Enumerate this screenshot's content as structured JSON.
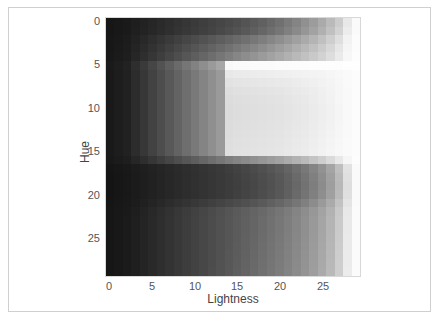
{
  "chart_data": {
    "type": "heatmap",
    "title": "",
    "xlabel": "Lightness",
    "ylabel": "Hue",
    "colormap": "grayscale",
    "x_ticks": [
      0,
      5,
      10,
      15,
      20,
      25
    ],
    "y_ticks": [
      0,
      5,
      10,
      15,
      20,
      25
    ],
    "xlim": [
      0,
      29
    ],
    "ylim": [
      29,
      0
    ],
    "grid": false,
    "legend": null,
    "n_rows": 30,
    "n_cols": 30,
    "value_range": [
      0,
      255
    ],
    "values": [
      [
        22,
        24,
        26,
        30,
        34,
        38,
        42,
        46,
        50,
        54,
        58,
        62,
        66,
        70,
        74,
        78,
        84,
        90,
        96,
        104,
        112,
        122,
        132,
        144,
        156,
        170,
        186,
        204,
        232,
        250
      ],
      [
        22,
        24,
        26,
        31,
        35,
        39,
        43,
        47,
        52,
        56,
        60,
        64,
        68,
        73,
        78,
        83,
        89,
        95,
        102,
        110,
        118,
        128,
        138,
        150,
        162,
        176,
        192,
        210,
        236,
        250
      ],
      [
        23,
        25,
        28,
        34,
        40,
        46,
        52,
        58,
        64,
        70,
        76,
        82,
        88,
        94,
        100,
        106,
        112,
        119,
        126,
        134,
        142,
        151,
        160,
        170,
        180,
        192,
        206,
        222,
        242,
        252
      ],
      [
        23,
        26,
        29,
        36,
        43,
        50,
        57,
        64,
        71,
        78,
        85,
        92,
        99,
        106,
        113,
        120,
        127,
        134,
        141,
        149,
        157,
        165,
        174,
        183,
        192,
        203,
        215,
        230,
        245,
        252
      ],
      [
        24,
        27,
        30,
        38,
        46,
        54,
        62,
        70,
        78,
        86,
        94,
        102,
        110,
        118,
        126,
        134,
        141,
        148,
        155,
        162,
        169,
        177,
        185,
        193,
        201,
        210,
        221,
        234,
        247,
        253
      ],
      [
        26,
        30,
        34,
        46,
        58,
        70,
        82,
        94,
        106,
        118,
        130,
        142,
        154,
        166,
        248,
        250,
        250,
        251,
        251,
        251,
        252,
        252,
        252,
        252,
        253,
        253,
        253,
        253,
        254,
        254
      ],
      [
        25,
        29,
        33,
        44,
        55,
        66,
        77,
        88,
        99,
        110,
        121,
        132,
        143,
        154,
        232,
        234,
        235,
        236,
        237,
        238,
        239,
        240,
        241,
        242,
        243,
        244,
        246,
        248,
        250,
        252
      ],
      [
        25,
        29,
        33,
        44,
        55,
        66,
        77,
        88,
        99,
        110,
        121,
        132,
        143,
        154,
        226,
        228,
        229,
        230,
        231,
        232,
        233,
        234,
        236,
        238,
        240,
        242,
        244,
        247,
        250,
        252
      ],
      [
        25,
        29,
        33,
        44,
        55,
        66,
        77,
        88,
        99,
        110,
        121,
        132,
        143,
        154,
        222,
        224,
        225,
        226,
        227,
        228,
        229,
        231,
        233,
        235,
        237,
        240,
        243,
        246,
        249,
        252
      ],
      [
        25,
        29,
        33,
        44,
        55,
        66,
        77,
        88,
        99,
        110,
        121,
        132,
        143,
        154,
        220,
        222,
        223,
        224,
        225,
        226,
        227,
        229,
        231,
        233,
        236,
        239,
        242,
        246,
        249,
        252
      ],
      [
        25,
        29,
        33,
        44,
        55,
        66,
        77,
        88,
        99,
        110,
        121,
        132,
        143,
        154,
        219,
        221,
        222,
        223,
        224,
        225,
        226,
        228,
        230,
        232,
        235,
        238,
        241,
        245,
        249,
        252
      ],
      [
        25,
        29,
        33,
        44,
        55,
        66,
        77,
        88,
        99,
        110,
        121,
        132,
        143,
        154,
        219,
        221,
        222,
        223,
        224,
        225,
        226,
        228,
        230,
        232,
        235,
        238,
        241,
        245,
        249,
        252
      ],
      [
        25,
        29,
        33,
        44,
        55,
        66,
        77,
        88,
        99,
        110,
        121,
        132,
        143,
        154,
        220,
        222,
        223,
        224,
        225,
        226,
        227,
        229,
        231,
        233,
        236,
        239,
        242,
        246,
        249,
        252
      ],
      [
        25,
        29,
        33,
        44,
        55,
        66,
        77,
        88,
        99,
        110,
        121,
        132,
        143,
        154,
        221,
        223,
        224,
        225,
        226,
        227,
        228,
        230,
        232,
        234,
        237,
        240,
        243,
        246,
        249,
        252
      ],
      [
        25,
        29,
        33,
        44,
        55,
        66,
        77,
        88,
        99,
        110,
        121,
        132,
        143,
        154,
        222,
        224,
        225,
        226,
        227,
        228,
        229,
        231,
        233,
        235,
        238,
        241,
        244,
        247,
        250,
        252
      ],
      [
        25,
        29,
        33,
        44,
        55,
        66,
        77,
        88,
        99,
        110,
        121,
        132,
        143,
        154,
        223,
        225,
        226,
        227,
        228,
        229,
        230,
        232,
        234,
        236,
        239,
        242,
        245,
        248,
        250,
        252
      ],
      [
        24,
        27,
        30,
        38,
        46,
        54,
        62,
        70,
        78,
        86,
        94,
        102,
        110,
        118,
        126,
        132,
        138,
        144,
        150,
        156,
        162,
        170,
        178,
        186,
        196,
        206,
        218,
        232,
        246,
        253
      ],
      [
        21,
        23,
        25,
        28,
        31,
        34,
        37,
        40,
        43,
        46,
        49,
        52,
        55,
        58,
        62,
        66,
        70,
        75,
        80,
        86,
        92,
        100,
        110,
        120,
        132,
        146,
        164,
        190,
        226,
        250
      ],
      [
        20,
        22,
        24,
        27,
        30,
        33,
        36,
        39,
        42,
        45,
        48,
        51,
        54,
        57,
        60,
        64,
        68,
        72,
        77,
        82,
        88,
        96,
        106,
        116,
        128,
        142,
        160,
        186,
        224,
        250
      ],
      [
        20,
        22,
        24,
        27,
        30,
        33,
        36,
        39,
        42,
        45,
        48,
        51,
        54,
        57,
        60,
        63,
        67,
        71,
        76,
        81,
        87,
        95,
        104,
        114,
        126,
        140,
        158,
        184,
        222,
        250
      ],
      [
        20,
        22,
        24,
        27,
        30,
        33,
        36,
        39,
        42,
        45,
        48,
        51,
        54,
        57,
        60,
        64,
        68,
        72,
        77,
        82,
        88,
        96,
        106,
        116,
        128,
        142,
        160,
        186,
        224,
        250
      ],
      [
        21,
        23,
        25,
        28,
        32,
        36,
        40,
        44,
        48,
        52,
        56,
        60,
        64,
        68,
        72,
        76,
        80,
        85,
        90,
        96,
        102,
        110,
        118,
        128,
        140,
        154,
        170,
        194,
        228,
        250
      ],
      [
        22,
        24,
        26,
        30,
        35,
        40,
        45,
        50,
        55,
        60,
        65,
        70,
        75,
        80,
        85,
        90,
        95,
        100,
        105,
        111,
        117,
        124,
        132,
        141,
        151,
        163,
        178,
        200,
        232,
        251
      ],
      [
        22,
        24,
        27,
        31,
        36,
        41,
        46,
        51,
        56,
        61,
        66,
        71,
        76,
        81,
        86,
        91,
        96,
        101,
        107,
        113,
        119,
        126,
        134,
        143,
        153,
        165,
        180,
        202,
        233,
        251
      ],
      [
        22,
        24,
        27,
        31,
        36,
        41,
        46,
        51,
        56,
        61,
        66,
        71,
        76,
        81,
        86,
        91,
        96,
        101,
        107,
        113,
        119,
        126,
        134,
        143,
        153,
        165,
        180,
        202,
        233,
        251
      ],
      [
        22,
        24,
        27,
        31,
        36,
        41,
        46,
        51,
        56,
        61,
        66,
        71,
        76,
        81,
        86,
        91,
        97,
        102,
        108,
        114,
        120,
        127,
        135,
        144,
        154,
        166,
        181,
        203,
        234,
        251
      ],
      [
        22,
        24,
        27,
        31,
        36,
        41,
        46,
        51,
        56,
        61,
        66,
        71,
        76,
        81,
        86,
        92,
        97,
        103,
        109,
        115,
        121,
        128,
        136,
        145,
        155,
        167,
        182,
        204,
        234,
        251
      ],
      [
        22,
        24,
        27,
        31,
        36,
        41,
        46,
        51,
        56,
        61,
        66,
        71,
        76,
        81,
        87,
        92,
        98,
        104,
        110,
        116,
        122,
        129,
        137,
        146,
        156,
        168,
        183,
        205,
        235,
        251
      ],
      [
        22,
        24,
        27,
        31,
        36,
        41,
        46,
        51,
        56,
        61,
        66,
        71,
        76,
        82,
        87,
        93,
        99,
        105,
        111,
        117,
        123,
        130,
        138,
        147,
        157,
        169,
        184,
        206,
        235,
        251
      ],
      [
        22,
        24,
        27,
        31,
        36,
        41,
        46,
        51,
        56,
        61,
        66,
        71,
        77,
        82,
        88,
        94,
        100,
        106,
        112,
        118,
        124,
        131,
        139,
        148,
        158,
        170,
        185,
        206,
        236,
        251
      ]
    ]
  },
  "axes": {
    "x_label": "Lightness",
    "y_label": "Hue",
    "x_tick_labels": [
      "0",
      "5",
      "10",
      "15",
      "20",
      "25"
    ],
    "y_tick_labels": [
      "0",
      "5",
      "10",
      "15",
      "20",
      "25"
    ]
  }
}
